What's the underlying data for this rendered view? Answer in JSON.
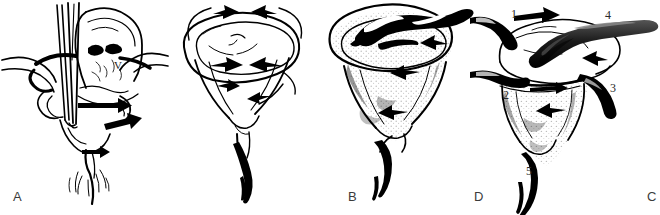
{
  "figure": {
    "background_color": "#ffffff",
    "ink_color": "#000000",
    "label_color": "#3b3b3b",
    "panel_count": 4
  },
  "panels": [
    {
      "id": "A",
      "caption": "A",
      "description": "Sagittal view of inverted uterus with two instrument shafts inserted through the vaginal canal; thick solid arrows indicate direction of replacement force.",
      "markers": [
        {
          "text": "V",
          "meaning": "vagina"
        }
      ]
    },
    {
      "id": "B",
      "caption": "B",
      "description": "Outline drawing of inverted uterine fundus forming a funnel; four curved arrows around the rim show the circumferential direction of pressure.",
      "markers": []
    },
    {
      "id": "C",
      "caption": "C",
      "description": "Shaded rendering of the inverted uterine funnel with a dark tubular structure crossing the rim and arrows indicating inward pressure.",
      "markers": []
    },
    {
      "id": "D",
      "caption": "D",
      "description": "Shaded inverted uterus with five numbered anatomical structures identified around the funnel rim and cord.",
      "markers": [
        {
          "text": "1",
          "meaning": "structure-one"
        },
        {
          "text": "2",
          "meaning": "structure-two"
        },
        {
          "text": "3",
          "meaning": "structure-three"
        },
        {
          "text": "4",
          "meaning": "structure-four"
        },
        {
          "text": "5",
          "meaning": "structure-five"
        }
      ]
    }
  ],
  "captions": {
    "a": "A",
    "b": "B",
    "c": "C",
    "d": "D"
  },
  "annotations": {
    "a_vagina": "V",
    "d_one": "1",
    "d_two": "2",
    "d_three": "3",
    "d_four": "4",
    "d_five": "5"
  }
}
